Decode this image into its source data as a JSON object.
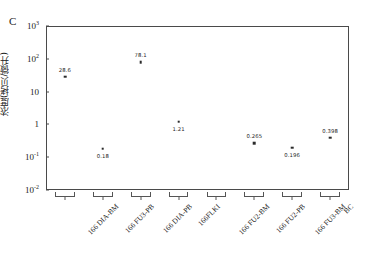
{
  "figure": {
    "panel_letter": "C",
    "y_axis_title": "浓度(拷贝/微升)"
  },
  "chart_data": {
    "type": "scatter",
    "title": "",
    "xlabel": "",
    "ylabel": "浓度(拷贝/微升)",
    "yscale": "log",
    "ylim": [
      0.01,
      1000
    ],
    "grid": false,
    "legend": "none",
    "y_ticks": [
      {
        "label": "10",
        "exp": "3",
        "value": 1000
      },
      {
        "label": "10",
        "exp": "2",
        "value": 100
      },
      {
        "label": "10",
        "exp": "",
        "value": 10
      },
      {
        "label": "1",
        "exp": "",
        "value": 1
      },
      {
        "label": "10",
        "exp": "-1",
        "value": 0.1
      },
      {
        "label": "10",
        "exp": "-2",
        "value": 0.01
      }
    ],
    "categories": [
      "166 DIA-BM",
      "166 FU3-PB",
      "166 DIA-PB",
      "166FLKI",
      "166 FU2-BM",
      "166 FU2-PB",
      "166 FU3-BM",
      "BC"
    ],
    "points": [
      {
        "category": "166 DIA-BM",
        "value": 28.6,
        "label": "28.6",
        "label_position": "above"
      },
      {
        "category": "166 FU3-PB",
        "value": 0.18,
        "label": "0.18",
        "label_position": "below"
      },
      {
        "category": "166 DIA-PB",
        "value": 78.1,
        "label": "78.1",
        "label_position": "above"
      },
      {
        "category": "166FLKI",
        "value": 1.21,
        "label": "1.21",
        "label_position": "below"
      },
      {
        "category": "166 FU2-BM",
        "value": null,
        "label": "",
        "label_position": "none"
      },
      {
        "category": "166 FU2-PB",
        "value": 0.265,
        "label": "0.265",
        "label_position": "above"
      },
      {
        "category": "166 FU3-BM",
        "value": 0.196,
        "label": "0.196",
        "label_position": "below"
      },
      {
        "category": "BC",
        "value": 0.398,
        "label": "0.398",
        "label_position": "above"
      }
    ]
  }
}
